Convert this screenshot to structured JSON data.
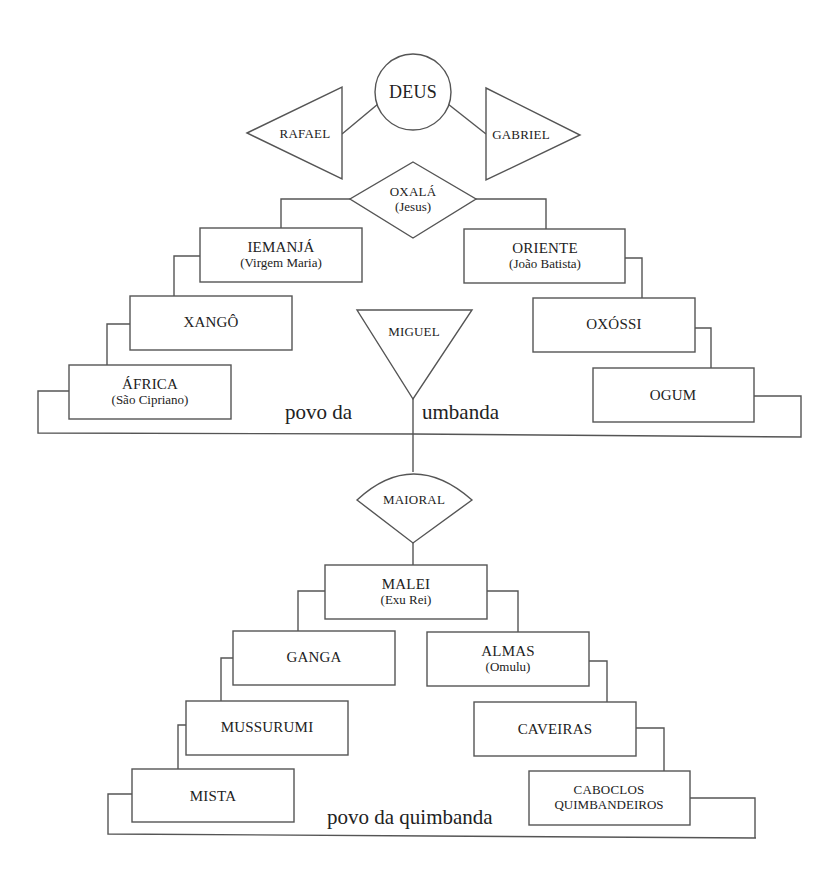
{
  "diagram": {
    "top": {
      "deus": "DEUS",
      "rafael": "RAFAEL",
      "gabriel": "GABRIEL",
      "oxala": {
        "name": "OXALÁ",
        "alias": "(Jesus)"
      }
    },
    "umbanda": {
      "left": [
        {
          "name": "IEMANJÁ",
          "alias": "(Virgem Maria)"
        },
        {
          "name": "XANGÔ",
          "alias": ""
        },
        {
          "name": "ÁFRICA",
          "alias": "(São Cipriano)"
        }
      ],
      "right": [
        {
          "name": "ORIENTE",
          "alias": "(João Batista)"
        },
        {
          "name": "OXÓSSI",
          "alias": ""
        },
        {
          "name": "OGUM",
          "alias": ""
        }
      ],
      "center": "MIGUEL",
      "caption_left": "povo da",
      "caption_right": "umbanda"
    },
    "quimbanda": {
      "maioral": "MAIORAL",
      "malei": {
        "name": "MALEI",
        "alias": "(Exu Rei)"
      },
      "left": [
        {
          "name": "GANGA",
          "alias": ""
        },
        {
          "name": "MUSSURUMI",
          "alias": ""
        },
        {
          "name": "MISTA",
          "alias": ""
        }
      ],
      "right": [
        {
          "name": "ALMAS",
          "alias": "(Omulu)"
        },
        {
          "name": "CAVEIRAS",
          "alias": ""
        },
        {
          "name": "CABOCLOS",
          "alias": "QUIMBANDEIROS"
        }
      ],
      "caption": "povo da quimbanda"
    }
  }
}
